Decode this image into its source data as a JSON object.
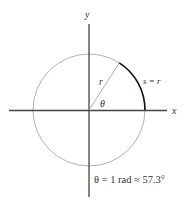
{
  "diagram": {
    "axes": {
      "x_label": "x",
      "y_label": "y",
      "color": "#444444"
    },
    "circle": {
      "cx": 89,
      "cy": 110,
      "r": 56,
      "color": "#a8a8a8"
    },
    "radius_line": {
      "label": "r",
      "color": "#a8a8a8"
    },
    "arc": {
      "label": "s = r",
      "color": "#111111"
    },
    "angle": {
      "label": "θ"
    },
    "caption": "θ = 1 rad ≈ 57.3°"
  }
}
